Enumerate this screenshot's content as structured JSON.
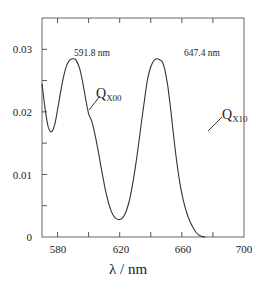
{
  "chart_data": {
    "type": "line",
    "title": "",
    "xlabel": "λ / nm",
    "ylabel": "",
    "xlim": [
      570,
      700
    ],
    "ylim": [
      0,
      0.035
    ],
    "grid": false,
    "legend": null,
    "x_ticks": [
      580,
      600,
      620,
      640,
      660,
      680,
      700
    ],
    "x_tick_labels": [
      "580",
      "620",
      "660",
      "700"
    ],
    "y_ticks": [
      0,
      0.005,
      0.01,
      0.015,
      0.02,
      0.025,
      0.03
    ],
    "y_tick_labels": [
      "0",
      "0.01",
      "0.02",
      "0.03"
    ],
    "series": [
      {
        "name": "absorbance",
        "x": [
          570,
          572,
          574,
          576,
          578,
          580,
          582,
          584,
          586,
          588,
          590,
          591.8,
          594,
          596,
          598,
          600,
          602,
          604,
          606,
          608,
          610,
          612,
          614,
          616,
          618,
          620,
          622,
          624,
          626,
          628,
          630,
          632,
          634,
          636,
          638,
          640,
          642,
          644,
          646,
          647.4,
          649,
          651,
          653,
          655,
          657,
          659,
          661,
          663,
          665,
          667,
          669,
          671,
          673,
          675
        ],
        "y": [
          0.0245,
          0.0205,
          0.0176,
          0.0168,
          0.0178,
          0.0203,
          0.0232,
          0.0258,
          0.0275,
          0.0283,
          0.0285,
          0.0283,
          0.0271,
          0.025,
          0.0222,
          0.0197,
          0.0185,
          0.0165,
          0.014,
          0.0112,
          0.0085,
          0.0062,
          0.0045,
          0.0034,
          0.0029,
          0.0028,
          0.0031,
          0.004,
          0.0056,
          0.008,
          0.011,
          0.0145,
          0.0183,
          0.022,
          0.0253,
          0.0272,
          0.0282,
          0.0285,
          0.0283,
          0.028,
          0.0268,
          0.024,
          0.02,
          0.0155,
          0.0115,
          0.0082,
          0.0058,
          0.004,
          0.0026,
          0.0016,
          0.0008,
          0.0003,
          0.0001,
          0.0
        ]
      }
    ],
    "annotations": [
      {
        "text": "591.8 nm",
        "x": 591.8,
        "y": 0.0285
      },
      {
        "text": "647.4 nm",
        "x": 647.4,
        "y": 0.0285
      },
      {
        "text": "Q",
        "sub": "X00",
        "points_to": {
          "x": 600,
          "y": 0.0197
        }
      },
      {
        "text": "Q",
        "sub": "X10",
        "points_to": {
          "x": 651,
          "y": 0.024
        }
      }
    ]
  },
  "labels": {
    "peak1": "591.8 nm",
    "peak2": "647.4 nm",
    "q1_main": "Q",
    "q1_sub": "X00",
    "q2_main": "Q",
    "q2_sub": "X10",
    "xtitle": "λ / nm",
    "xt0": "580",
    "xt1": "620",
    "xt2": "660",
    "xt3": "700",
    "yt0": "0",
    "yt1": "0.01",
    "yt2": "0.02",
    "yt3": "0.03"
  },
  "colors": {
    "line": "#333333",
    "axis": "#555555",
    "text": "#222222"
  }
}
